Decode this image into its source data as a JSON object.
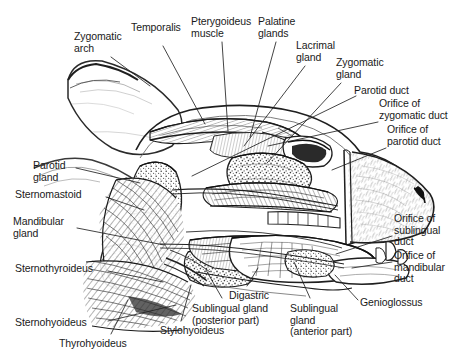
{
  "figure": {
    "type": "anatomical-illustration",
    "style": "black-and-white pen-and-ink line drawing with stipple and hatching",
    "background_color": "#ffffff",
    "ink_color": "#1a1a1a",
    "leader_line_color": "#222222"
  },
  "labels": [
    {
      "id": "zygomatic-arch",
      "lines": [
        "Zygomatic",
        "arch"
      ],
      "x": 74,
      "y": 31,
      "align": "left"
    },
    {
      "id": "temporalis",
      "lines": [
        "Temporalis"
      ],
      "x": 131,
      "y": 22,
      "align": "left"
    },
    {
      "id": "pterygoideus-muscle",
      "lines": [
        "Pterygoideus",
        "muscle"
      ],
      "x": 191,
      "y": 16,
      "align": "left"
    },
    {
      "id": "palatine-glands",
      "lines": [
        "Palatine",
        "glands"
      ],
      "x": 258,
      "y": 16,
      "align": "left"
    },
    {
      "id": "lacrimal-gland",
      "lines": [
        "Lacrimal",
        "gland"
      ],
      "x": 296,
      "y": 40,
      "align": "left"
    },
    {
      "id": "zygomatic-gland",
      "lines": [
        "Zygomatic",
        "gland"
      ],
      "x": 336,
      "y": 57,
      "align": "left"
    },
    {
      "id": "parotid-duct",
      "lines": [
        "Parotid duct"
      ],
      "x": 354,
      "y": 85,
      "align": "left"
    },
    {
      "id": "orifice-zygomatic-duct",
      "lines": [
        "Orifice of",
        "zygomatic duct"
      ],
      "x": 379,
      "y": 98,
      "align": "left"
    },
    {
      "id": "orifice-parotid-duct",
      "lines": [
        "Orifice of",
        "parotid duct"
      ],
      "x": 387,
      "y": 124,
      "align": "left"
    },
    {
      "id": "orifice-sublingual-duct",
      "lines": [
        "Orifice of",
        "sublingual",
        "duct"
      ],
      "x": 394,
      "y": 213,
      "align": "left"
    },
    {
      "id": "orifice-mandibular-duct",
      "lines": [
        "Orifice of",
        "mandibular",
        "duct"
      ],
      "x": 394,
      "y": 250,
      "align": "left"
    },
    {
      "id": "parotid-gland",
      "lines": [
        "Parotid",
        "gland"
      ],
      "x": 33,
      "y": 160,
      "align": "left"
    },
    {
      "id": "sternomastoid",
      "lines": [
        "Sternomastoid"
      ],
      "x": 15,
      "y": 189,
      "align": "left"
    },
    {
      "id": "mandibular-gland",
      "lines": [
        "Mandibular",
        "gland"
      ],
      "x": 13,
      "y": 216,
      "align": "left"
    },
    {
      "id": "sternothyroideus",
      "lines": [
        "Sternothyroideus"
      ],
      "x": 15,
      "y": 263,
      "align": "left"
    },
    {
      "id": "sternohyoideus",
      "lines": [
        "Sternohyoideus"
      ],
      "x": 15,
      "y": 317,
      "align": "left"
    },
    {
      "id": "thyrohyoideus",
      "lines": [
        "Thyrohyoideus"
      ],
      "x": 59,
      "y": 338,
      "align": "left"
    },
    {
      "id": "stylohyoideus",
      "lines": [
        "Stylohyoideus"
      ],
      "x": 160,
      "y": 325,
      "align": "left"
    },
    {
      "id": "sublingual-gland-posterior",
      "lines": [
        "Sublingual gland",
        "(posterior part)"
      ],
      "x": 192,
      "y": 303,
      "align": "left"
    },
    {
      "id": "digastric",
      "lines": [
        "Digastric"
      ],
      "x": 229,
      "y": 290,
      "align": "left"
    },
    {
      "id": "sublingual-gland-anterior",
      "lines": [
        "Sublingual",
        "gland",
        "(anterior part)"
      ],
      "x": 290,
      "y": 303,
      "align": "left"
    },
    {
      "id": "genioglossus",
      "lines": [
        "Genioglossus"
      ],
      "x": 360,
      "y": 297,
      "align": "left"
    }
  ],
  "leaders": [
    {
      "id": "leader-zygomatic-arch",
      "points": "111,57 150,86"
    },
    {
      "id": "leader-temporalis",
      "points": "163,46 205,124"
    },
    {
      "id": "leader-pterygoideus",
      "points": "222,42 228,131"
    },
    {
      "id": "leader-palatine-glands",
      "points": "276,42 250,137"
    },
    {
      "id": "leader-lacrimal-gland",
      "points": "305,66 244,146"
    },
    {
      "id": "leader-zygomatic-gland",
      "points": "341,83 267,163"
    },
    {
      "id": "leader-parotid-duct",
      "points": "356,96 192,176"
    },
    {
      "id": "leader-orifice-zygomatic",
      "points": "378,122 268,146"
    },
    {
      "id": "leader-orifice-parotid",
      "points": "386,148 332,170"
    },
    {
      "id": "leader-orifice-sublingual",
      "points": "392,236 336,254"
    },
    {
      "id": "leader-orifice-mandibular",
      "points": "392,262 352,268"
    },
    {
      "id": "leader-parotid-gland",
      "points": "76,168 140,183"
    },
    {
      "id": "leader-sternomastoid",
      "points": "106,197 144,210"
    },
    {
      "id": "leader-mandibular-gland",
      "points": "77,228 164,245"
    },
    {
      "id": "leader-sternothyroideus",
      "points": "108,271 163,282"
    },
    {
      "id": "leader-sternohyoideus",
      "points": "108,321 176,305"
    },
    {
      "id": "leader-thyrohyoideus",
      "points": "111,334 128,300"
    },
    {
      "id": "leader-stylohyoideus",
      "points": "181,321 191,285"
    },
    {
      "id": "leader-sublingual-posterior",
      "points": "222,298 206,270"
    },
    {
      "id": "leader-digastric",
      "points": "247,286 258,268"
    },
    {
      "id": "leader-sublingual-anterior",
      "points": "310,298 294,262"
    },
    {
      "id": "leader-genioglossus",
      "points": "358,300 335,275"
    }
  ]
}
